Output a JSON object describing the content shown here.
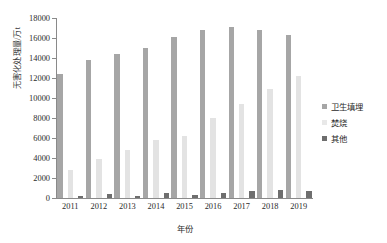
{
  "chart_data": {
    "type": "bar",
    "title": "",
    "xlabel": "年份",
    "ylabel": "无害化处理量/万t",
    "categories": [
      "2011",
      "2012",
      "2013",
      "2014",
      "2015",
      "2016",
      "2017",
      "2018",
      "2019"
    ],
    "series": [
      {
        "name": "卫生填埋",
        "color": "#a6a6a6",
        "values": [
          12400,
          13800,
          14400,
          15000,
          16100,
          16800,
          17100,
          16800,
          16300
        ]
      },
      {
        "name": "焚烧",
        "color": "#e3e3e3",
        "values": [
          2800,
          3900,
          4800,
          5800,
          6200,
          8000,
          9400,
          10900,
          12200
        ]
      },
      {
        "name": "其他",
        "color": "#6e6e6e",
        "values": [
          250,
          400,
          250,
          550,
          350,
          500,
          700,
          800,
          700
        ]
      }
    ],
    "ylim": [
      0,
      18000
    ],
    "yticks": [
      0,
      2000,
      4000,
      6000,
      8000,
      10000,
      12000,
      14000,
      16000,
      18000
    ],
    "ytick_labels": [
      "0",
      "2000",
      "4000",
      "6000",
      "8000",
      "10000",
      "12000",
      "14000",
      "16000",
      "18000"
    ],
    "grid": false,
    "legend_position": "right"
  }
}
